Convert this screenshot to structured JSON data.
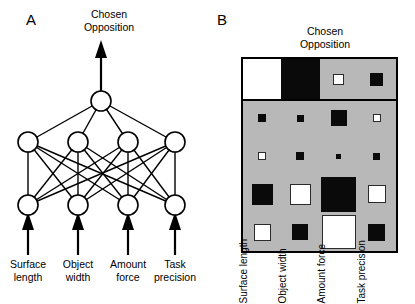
{
  "figure": {
    "panels": [
      {
        "letter": "A",
        "title_line1": "Chosen",
        "title_line2": "Opposition"
      },
      {
        "letter": "B",
        "title_line1": "Chosen",
        "title_line2": "Opposition"
      }
    ]
  },
  "network": {
    "output_label_line1": "Chosen",
    "output_label_line2": "Opposition",
    "layers": [
      {
        "name": "output",
        "node_count": 1
      },
      {
        "name": "hidden",
        "node_count": 4
      },
      {
        "name": "input",
        "node_count": 4
      }
    ],
    "inputs": [
      {
        "line1": "Surface",
        "line2": "length"
      },
      {
        "line1": "Object",
        "line2": "width"
      },
      {
        "line1": "Amount",
        "line2": "force"
      },
      {
        "line1": "Task",
        "line2": "precision"
      }
    ]
  },
  "matrix": {
    "title_line1": "Chosen",
    "title_line2": "Opposition",
    "background_color": "#b8b8b8",
    "positive_color": "#ffffff",
    "negative_color": "#0a0a0a",
    "border_color": "#000000",
    "column_labels": [
      {
        "line1": "Surface",
        "line2": "length"
      },
      {
        "line1": "Object",
        "line2": "width"
      },
      {
        "line1": "Amount",
        "line2": "force"
      },
      {
        "line1": "Task",
        "line2": "precision"
      }
    ],
    "row_names": [
      "output-weights",
      "hidden-unit-1",
      "hidden-unit-2",
      "hidden-unit-3",
      "hidden-unit-4"
    ],
    "cells": [
      [
        {
          "sign": "pos",
          "size": 39
        },
        {
          "sign": "neg",
          "size": 39
        },
        {
          "sign": "pos",
          "size": 11
        },
        {
          "sign": "neg",
          "size": 13
        }
      ],
      [
        {
          "sign": "neg",
          "size": 8
        },
        {
          "sign": "neg",
          "size": 7
        },
        {
          "sign": "neg",
          "size": 16
        },
        {
          "sign": "pos",
          "size": 8
        }
      ],
      [
        {
          "sign": "pos",
          "size": 8
        },
        {
          "sign": "neg",
          "size": 8
        },
        {
          "sign": "neg",
          "size": 5
        },
        {
          "sign": "neg",
          "size": 7
        }
      ],
      [
        {
          "sign": "neg",
          "size": 21
        },
        {
          "sign": "pos",
          "size": 21
        },
        {
          "sign": "neg",
          "size": 35
        },
        {
          "sign": "pos",
          "size": 18
        }
      ],
      [
        {
          "sign": "pos",
          "size": 17
        },
        {
          "sign": "neg",
          "size": 16
        },
        {
          "sign": "pos",
          "size": 34
        },
        {
          "sign": "neg",
          "size": 17
        }
      ]
    ]
  }
}
